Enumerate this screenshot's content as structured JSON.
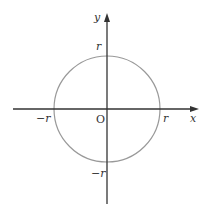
{
  "diagram": {
    "type": "circle-on-axes",
    "origin": {
      "x": 107,
      "y": 109
    },
    "radius_px": 53,
    "colors": {
      "axis": "#333333",
      "circle": "#999999"
    },
    "axes": {
      "x": {
        "label": "x",
        "from": 13,
        "to": 198
      },
      "y": {
        "label": "y",
        "from": 204,
        "to": 13
      }
    },
    "labels": {
      "origin": "O",
      "r_x": "r",
      "neg_r_x": "−r",
      "r_y": "r",
      "neg_r_y": "−r"
    }
  }
}
